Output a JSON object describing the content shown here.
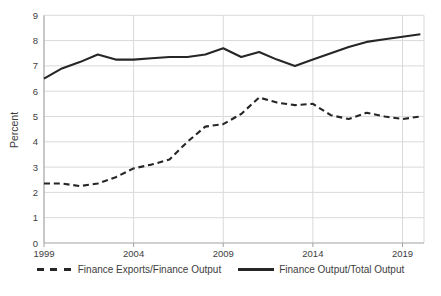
{
  "chart_data": {
    "type": "line",
    "title": "",
    "xlabel": "",
    "ylabel": "Percent",
    "x": [
      1999,
      2000,
      2001,
      2002,
      2003,
      2004,
      2005,
      2006,
      2007,
      2008,
      2009,
      2010,
      2011,
      2012,
      2013,
      2014,
      2015,
      2016,
      2017,
      2018,
      2019,
      2020
    ],
    "series": [
      {
        "name": "Finance Exports/Finance Output",
        "style": "dashed",
        "values": [
          2.35,
          2.35,
          2.25,
          2.35,
          2.6,
          2.95,
          3.1,
          3.3,
          4.0,
          4.6,
          4.7,
          5.1,
          5.75,
          5.55,
          5.45,
          5.5,
          5.05,
          4.9,
          5.15,
          5.0,
          4.9,
          5.0
        ]
      },
      {
        "name": "Finance Output/Total Output",
        "style": "solid",
        "values": [
          6.5,
          6.9,
          7.15,
          7.45,
          7.25,
          7.25,
          7.3,
          7.35,
          7.35,
          7.45,
          7.7,
          7.35,
          7.55,
          7.25,
          7.0,
          7.25,
          7.5,
          7.75,
          7.95,
          8.05,
          8.15,
          8.25
        ]
      }
    ],
    "xlim": [
      1999,
      2020.2
    ],
    "ylim": [
      0,
      9
    ],
    "y_ticks": [
      "0",
      "1",
      "2",
      "3",
      "4",
      "5",
      "6",
      "7",
      "8",
      "9"
    ],
    "x_ticks": [
      "1999",
      "2004",
      "2009",
      "2014",
      "2019"
    ],
    "x_tick_values": [
      1999,
      2004,
      2009,
      2014,
      2019
    ],
    "grid": true,
    "legend_position": "bottom",
    "colors": {
      "line": "#262626",
      "gridline": "#d9d9d9",
      "axis": "#a3a3a3",
      "text": "#3d3d3d"
    }
  }
}
